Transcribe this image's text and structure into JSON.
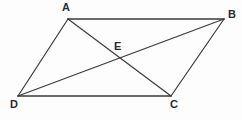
{
  "figure": {
    "shape_type": "parallelogram",
    "background_color": "#fdfdfd",
    "stroke_color": "#3a3a3a",
    "stroke_width": 1.2,
    "label_color": "#2b2b2b",
    "canvas": {
      "width": 242,
      "height": 120
    },
    "points": {
      "A": {
        "label": "A",
        "x": 68,
        "y": 19,
        "label_x": 62,
        "label_y": 2
      },
      "B": {
        "label": "B",
        "x": 224,
        "y": 19,
        "label_x": 228,
        "label_y": 9
      },
      "C": {
        "label": "C",
        "x": 171,
        "y": 96,
        "label_x": 170,
        "label_y": 99
      },
      "D": {
        "label": "D",
        "x": 18,
        "y": 96,
        "label_x": 10,
        "label_y": 99
      },
      "E": {
        "label": "E",
        "x": 120,
        "y": 58,
        "label_x": 114,
        "label_y": 41
      }
    },
    "segments": [
      {
        "name": "side-AB",
        "from": "A",
        "to": "B"
      },
      {
        "name": "side-BC",
        "from": "B",
        "to": "C"
      },
      {
        "name": "side-CD",
        "from": "C",
        "to": "D"
      },
      {
        "name": "side-DA",
        "from": "D",
        "to": "A"
      },
      {
        "name": "diagonal-AC",
        "from": "A",
        "to": "C"
      },
      {
        "name": "diagonal-BD",
        "from": "B",
        "to": "D"
      }
    ]
  }
}
